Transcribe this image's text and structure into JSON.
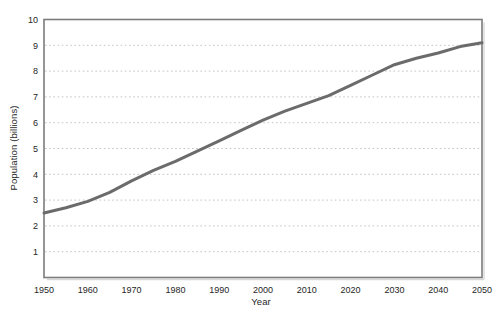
{
  "figure": {
    "background": "#ffffff"
  },
  "chart_data": {
    "type": "line",
    "title": "",
    "xlabel": "Year",
    "ylabel": "Population (billions)",
    "x": [
      1950,
      1955,
      1960,
      1965,
      1970,
      1975,
      1980,
      1985,
      1990,
      1995,
      2000,
      2005,
      2010,
      2015,
      2020,
      2025,
      2030,
      2035,
      2040,
      2045,
      2050
    ],
    "values": [
      2.5,
      2.7,
      2.95,
      3.3,
      3.75,
      4.15,
      4.5,
      4.9,
      5.3,
      5.7,
      6.1,
      6.45,
      6.75,
      7.05,
      7.45,
      7.85,
      8.25,
      8.5,
      8.7,
      8.95,
      9.1
    ],
    "xlim": [
      1950,
      2050
    ],
    "ylim": [
      0,
      10
    ],
    "x_ticks": [
      1950,
      1960,
      1970,
      1980,
      1990,
      2000,
      2010,
      2020,
      2030,
      2040,
      2050
    ],
    "y_ticks": [
      1,
      2,
      3,
      4,
      5,
      6,
      7,
      8,
      9,
      10
    ],
    "grid": "horizontal-dotted",
    "legend": "none",
    "line_color": "#6b6b6b",
    "frame_color": "#7c7c7c",
    "shadow_color": "#d6d6d6",
    "grid_color": "#c4c4c4",
    "text_color": "#262626"
  }
}
